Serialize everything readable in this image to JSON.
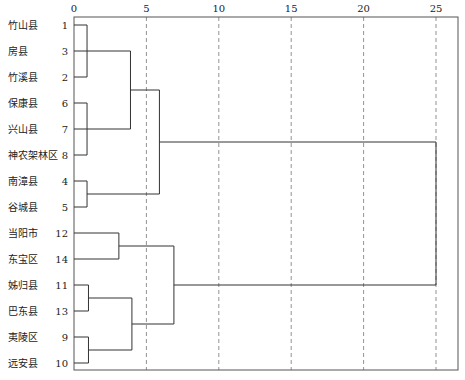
{
  "chart_data": {
    "type": "dendrogram",
    "title": "",
    "xlabel": "",
    "ylabel": "",
    "x_ticks": [
      0,
      5,
      10,
      15,
      20,
      25
    ],
    "xlim": [
      0,
      26.5
    ],
    "grid": "vertical dashed at ticks 5-25",
    "leaves": [
      {
        "name": "竹山县",
        "id": 1
      },
      {
        "name": "房县",
        "id": 3
      },
      {
        "name": "竹溪县",
        "id": 2
      },
      {
        "name": "保康县",
        "id": 6
      },
      {
        "name": "兴山县",
        "id": 7
      },
      {
        "name": "神农架林区",
        "id": 8
      },
      {
        "name": "南漳县",
        "id": 4
      },
      {
        "name": "谷城县",
        "id": 5
      },
      {
        "name": "当阳市",
        "id": 12
      },
      {
        "name": "东宝区",
        "id": 14
      },
      {
        "name": "姊归县",
        "id": 11
      },
      {
        "name": "巴东县",
        "id": 13
      },
      {
        "name": "夷陵区",
        "id": 9
      },
      {
        "name": "远安县",
        "id": 10
      }
    ],
    "merges": [
      {
        "members": [
          1,
          3,
          2
        ],
        "distance": 0.9
      },
      {
        "members": [
          6,
          7,
          8
        ],
        "distance": 0.9
      },
      {
        "members": [
          4,
          5
        ],
        "distance": 0.9
      },
      {
        "members": [
          11,
          13
        ],
        "distance": 1.0
      },
      {
        "members": [
          9,
          10
        ],
        "distance": 1.0
      },
      {
        "members": [
          12,
          14
        ],
        "distance": 3.1
      },
      {
        "members": [
          1,
          3,
          2,
          6,
          7,
          8
        ],
        "distance": 3.9
      },
      {
        "members": [
          11,
          13,
          9,
          10
        ],
        "distance": 4.0
      },
      {
        "members": [
          1,
          3,
          2,
          6,
          7,
          8,
          4,
          5
        ],
        "distance": 5.9
      },
      {
        "members": [
          12,
          14,
          11,
          13,
          9,
          10
        ],
        "distance": 6.9
      },
      {
        "members": [
          1,
          3,
          2,
          6,
          7,
          8,
          4,
          5,
          12,
          14,
          11,
          13,
          9,
          10
        ],
        "distance": 25
      }
    ]
  }
}
